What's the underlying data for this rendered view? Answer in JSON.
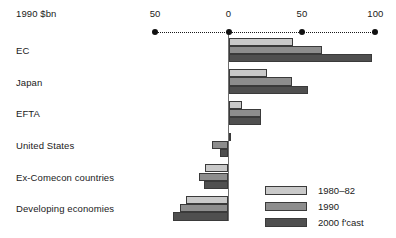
{
  "chart_data": {
    "type": "bar",
    "orientation": "horizontal",
    "title": "",
    "subtitle": "",
    "xlabel": "1990 $bn",
    "ylabel": "",
    "unit_label": "1990 $bn",
    "grid": false,
    "axis": {
      "ticks": [
        -50,
        0,
        50,
        100
      ],
      "tick_labels": [
        "50",
        "0",
        "50",
        "100"
      ],
      "xlim": [
        -50,
        100
      ],
      "dotted_axis": true,
      "tick_marker": "dot"
    },
    "categories": [
      "EC",
      "Japan",
      "EFTA",
      "United States",
      "Ex-Comecon countries",
      "Developing economies"
    ],
    "series": [
      {
        "name": "1980–82",
        "color": "#c9c9c9",
        "values": [
          44,
          26,
          9,
          1,
          -16,
          -29
        ]
      },
      {
        "name": "1990",
        "color": "#8d8d8d",
        "values": [
          64,
          43,
          22,
          -11,
          -20,
          -33
        ]
      },
      {
        "name": "2000 f'cast",
        "color": "#4f4f4f",
        "values": [
          98,
          54,
          22,
          -6,
          -17,
          -38
        ]
      }
    ],
    "legend": {
      "position": "bottom-right",
      "entries": [
        "1980–82",
        "1990",
        "2000 f'cast"
      ]
    },
    "colors": {
      "series_light": "#c9c9c9",
      "series_medium": "#8d8d8d",
      "series_dark": "#4f4f4f",
      "outline": "#3a3a3a",
      "axis": "#111111",
      "text": "#1a1a1a",
      "background": "#ffffff"
    }
  }
}
